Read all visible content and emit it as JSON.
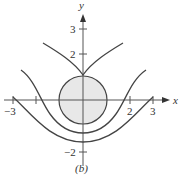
{
  "figure": {
    "caption": "(b)",
    "axes": {
      "x_label": "x",
      "y_label": "y",
      "x_ticks": [
        {
          "value": -3,
          "label": "−3"
        },
        {
          "value": -2,
          "label": ""
        },
        {
          "value": 2,
          "label": "2"
        },
        {
          "value": 3,
          "label": "3"
        }
      ],
      "y_ticks": [
        {
          "value": 3,
          "label": "3"
        },
        {
          "value": 2,
          "label": "2"
        },
        {
          "value": -2,
          "label": "−2"
        }
      ]
    },
    "shapes": [
      {
        "type": "circle",
        "center": [
          0,
          0
        ],
        "radius": 1,
        "fill": "#e6e6e6"
      },
      {
        "type": "curve",
        "name": "upper-v-curve",
        "vertex": [
          0,
          1.05
        ]
      },
      {
        "type": "curve",
        "name": "middle-u-curve",
        "vertex": [
          0,
          -1.05
        ]
      },
      {
        "type": "curve",
        "name": "lower-u-curve",
        "vertex": [
          0,
          -1.4
        ]
      }
    ]
  }
}
